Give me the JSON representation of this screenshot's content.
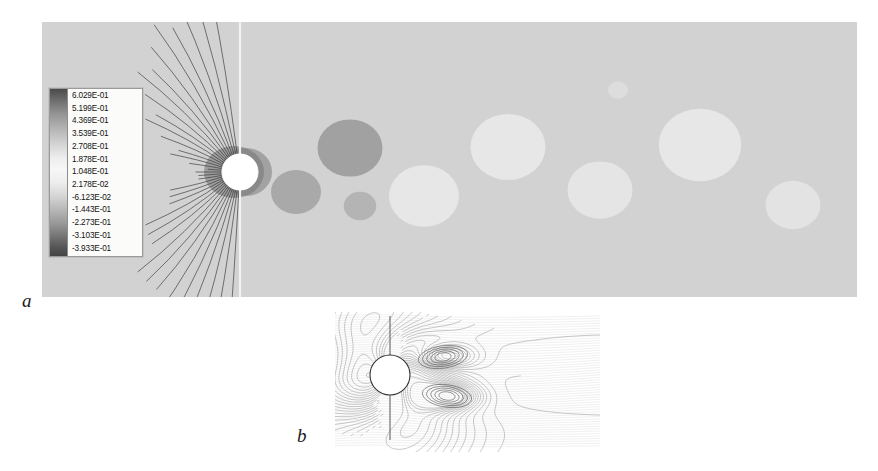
{
  "figure": {
    "type": "scientific-contour-figure",
    "background_color": "#ffffff"
  },
  "panels": [
    {
      "id": "a",
      "label": "a",
      "caption_label": "a",
      "x": 42,
      "y": 22,
      "width": 815,
      "height": 275,
      "background_color": "#d2d2d2",
      "field_description": "Unsteady von Karman vortex street: alternating positive and negative contour cores shed downstream of the cylinder",
      "cylinder": {
        "cx": 240,
        "cy": 172,
        "r": 18,
        "fill": "#ffffff"
      },
      "symmetry_line": {
        "x": 240,
        "from_y": 22,
        "to_y": 297,
        "color": "#f2f2f2"
      }
    },
    {
      "id": "b",
      "label": "b",
      "caption_label": "b",
      "x": 335,
      "y": 312,
      "width": 265,
      "height": 140,
      "background_color": "#ffffff",
      "field_description": "Steady symmetric near-wake: twin counter-rotating recirculation bubbles immediately behind the cylinder",
      "cylinder": {
        "cx": 390,
        "cy": 375,
        "r": 20,
        "fill": "#ffffff"
      },
      "symmetry_line": {
        "x": 390,
        "from_y": 316,
        "to_y": 440,
        "color": "#555555"
      }
    }
  ],
  "legend": {
    "name": "contour-level-legend",
    "position": {
      "x": 49,
      "y": 88,
      "width": 92,
      "height": 167
    },
    "colorbar": {
      "orientation": "vertical",
      "high_color": "#4a4a4a",
      "mid_color": "#f7f7f7",
      "low_color": "#454545"
    },
    "levels": [
      "6.029E-01",
      "5.199E-01",
      "4.369E-01",
      "3.539E-01",
      "2.708E-01",
      "1.878E-01",
      "1.048E-01",
      "2.178E-02",
      "-6.123E-02",
      "-1.443E-01",
      "-2.273E-01",
      "-3.103E-01",
      "-3.933E-01"
    ]
  },
  "chart_data": {
    "type": "contour",
    "title": "",
    "xlabel": "",
    "ylabel": "",
    "grid": false,
    "legend_position": "inside-left",
    "contour_levels": [
      0.6029,
      0.5199,
      0.4369,
      0.3539,
      0.2708,
      0.1878,
      0.1048,
      0.02178,
      -0.06123,
      -0.1443,
      -0.2273,
      -0.3103,
      -0.3933
    ],
    "level_interval": 0.083,
    "value_max": 0.6029,
    "value_min": -0.3933,
    "colormap": "grayscale-diverging",
    "panels": [
      {
        "id": "a",
        "label": "a",
        "regime": "unsteady-vortex-shedding",
        "domain_px": {
          "x0": 42,
          "y0": 22,
          "x1": 857,
          "y1": 297
        },
        "cylinder_center_px": [
          240,
          172
        ],
        "cylinder_radius_px": 18,
        "vortex_cores": [
          {
            "x": 350,
            "y": 148,
            "sign": -1,
            "strength": 0.95,
            "radius": 26,
            "label": "negative-core-1-upper"
          },
          {
            "x": 296,
            "y": 192,
            "sign": -1,
            "strength": 0.7,
            "radius": 20,
            "label": "negative-core-2-lower"
          },
          {
            "x": 360,
            "y": 206,
            "sign": -1,
            "strength": 0.32,
            "radius": 13,
            "label": "small-negative-core-lower"
          },
          {
            "x": 424,
            "y": 196,
            "sign": 1,
            "strength": 0.88,
            "radius": 28,
            "label": "positive-core-1-lower"
          },
          {
            "x": 508,
            "y": 147,
            "sign": 1,
            "strength": 0.92,
            "radius": 30,
            "label": "positive-core-2-upper"
          },
          {
            "x": 600,
            "y": 190,
            "sign": 1,
            "strength": 0.78,
            "radius": 26,
            "label": "positive-core-3-lower"
          },
          {
            "x": 700,
            "y": 145,
            "sign": 1,
            "strength": 0.96,
            "radius": 33,
            "label": "positive-core-4-upper"
          },
          {
            "x": 793,
            "y": 205,
            "sign": 1,
            "strength": 0.6,
            "radius": 22,
            "label": "positive-core-5-lower"
          },
          {
            "x": 618,
            "y": 90,
            "sign": 1,
            "strength": 0.18,
            "radius": 8,
            "label": "tiny-core-upper"
          }
        ],
        "stagnation_fan": {
          "x": 222,
          "y": 172,
          "description": "dense radial contour fan upstream of cylinder"
        }
      },
      {
        "id": "b",
        "label": "b",
        "regime": "steady-symmetric-wake",
        "domain_px": {
          "x0": 335,
          "y0": 312,
          "x1": 600,
          "y1": 452
        },
        "cylinder_center_px": [
          390,
          375
        ],
        "cylinder_radius_px": 20,
        "vortex_cores": [
          {
            "x": 443,
            "y": 357,
            "sign": 1,
            "strength": 0.55,
            "radius": 16,
            "label": "upper-recirculation-bubble"
          },
          {
            "x": 447,
            "y": 396,
            "sign": -1,
            "strength": 0.62,
            "radius": 16,
            "label": "lower-recirculation-bubble"
          }
        ]
      }
    ]
  }
}
